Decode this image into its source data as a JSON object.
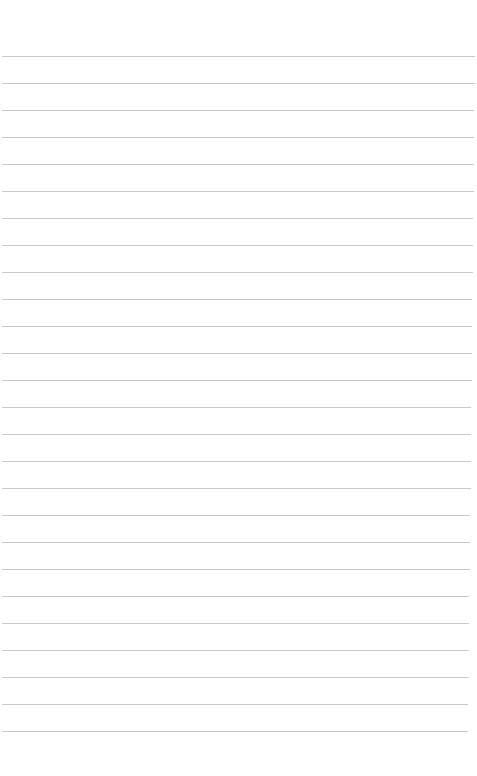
{
  "page": {
    "type": "lined-paper",
    "background_color": "#ffffff",
    "line_color": "#c9c9c9",
    "line_count": 26,
    "first_line_y": 56,
    "line_spacing": 27,
    "line_left": 2,
    "line_right_top": 475,
    "line_right_bottom": 468
  }
}
